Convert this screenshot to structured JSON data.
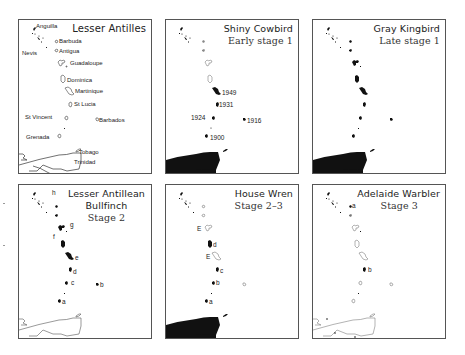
{
  "figure": {
    "panels": [
      {
        "id": "lesser-antilles",
        "title": "Lesser Antilles",
        "subtitle": "",
        "island_labels": {
          "anguilla": "Anguilla",
          "barbuda": "Barbuda",
          "nevis": "Nevis",
          "antigua": "Antigua",
          "guadeloupe": "Guadaloupe",
          "dominica": "Dominica",
          "martinique": "Martinique",
          "st_lucia": "St Lucia",
          "st_vincent": "St Vincent",
          "barbados": "Barbados",
          "grenada": "Grenada",
          "tobago": "Tobago",
          "trinidad": "Trinidad"
        }
      },
      {
        "id": "shiny-cowbird",
        "title": "Shiny Cowbird",
        "subtitle": "Early stage 1",
        "year_labels": {
          "martinique": "1949",
          "st_lucia": "1931",
          "st_vincent": "1924",
          "barbados": "1916",
          "grenada": "1900"
        }
      },
      {
        "id": "gray-kingbird",
        "title": "Gray Kingbird",
        "subtitle": "Late stage 1"
      },
      {
        "id": "lesser-antillean-bullfinch",
        "title_line1": "Lesser Antillean",
        "title_line2": "Bullfinch",
        "subtitle": "Stage 2",
        "subspecies_labels": {
          "h": "h",
          "g": "g",
          "f": "f",
          "e": "e",
          "d": "d",
          "c": "c",
          "b": "b",
          "a": "a"
        }
      },
      {
        "id": "house-wren",
        "title": "House Wren",
        "subtitle": "Stage 2–3",
        "subspecies_labels": {
          "e1": "E",
          "d": "d",
          "e2": "E",
          "c": "c",
          "b": "b",
          "a": "a"
        }
      },
      {
        "id": "adelaide-warbler",
        "title": "Adelaide Warbler",
        "subtitle": "Stage 3",
        "subspecies_labels": {
          "a": "a",
          "b": "b"
        }
      }
    ],
    "legend": {
      "filled_island": "species present",
      "outline_island": "species absent",
      "E": "extinct population"
    }
  }
}
